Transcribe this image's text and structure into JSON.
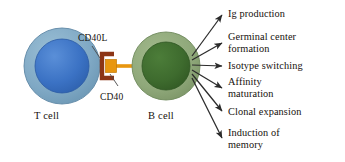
{
  "diagram": {
    "background_color": "#ffffff",
    "cells": [
      {
        "id": "t-cell",
        "label": "T cell",
        "cytoplasm_color": "#7FA8C4",
        "nucleus_color": "#3B72C4",
        "cx": 62,
        "cy": 66,
        "r_outer": 38,
        "r_inner": 27
      },
      {
        "id": "b-cell",
        "label": "B cell",
        "cytoplasm_color": "#8FA87A",
        "nucleus_color": "#3E6B2E",
        "cx": 166,
        "cy": 66,
        "r_outer": 34,
        "r_inner": 24
      }
    ],
    "receptors": [
      {
        "id": "cd40l",
        "label": "CD40L",
        "color": "#E8960F",
        "description": "orange square ligand on T cell"
      },
      {
        "id": "cd40",
        "label": "CD40",
        "color": "#8C3516",
        "description": "dark red bracket receptor on B cell"
      }
    ],
    "stem_color": "#E8960F",
    "leader_line_color": "#4a4a4a",
    "arrow_color": "#2b2b2b",
    "arrow_origin": {
      "x": 190,
      "y": 66
    },
    "outcomes": [
      {
        "label": "Ig production",
        "tip_x": 224,
        "tip_y": 14,
        "text_top": 8
      },
      {
        "label": "Germinal center\nformation",
        "tip_x": 224,
        "tip_y": 43,
        "text_top": 31
      },
      {
        "label": "Isotype switching",
        "tip_x": 224,
        "tip_y": 66,
        "text_top": 60
      },
      {
        "label": "Affinity\nmaturation",
        "tip_x": 224,
        "tip_y": 88,
        "text_top": 76
      },
      {
        "label": "Clonal expansion",
        "tip_x": 224,
        "tip_y": 112,
        "text_top": 106
      },
      {
        "label": "Induction of\nmemory",
        "tip_x": 224,
        "tip_y": 139,
        "text_top": 127
      }
    ]
  }
}
